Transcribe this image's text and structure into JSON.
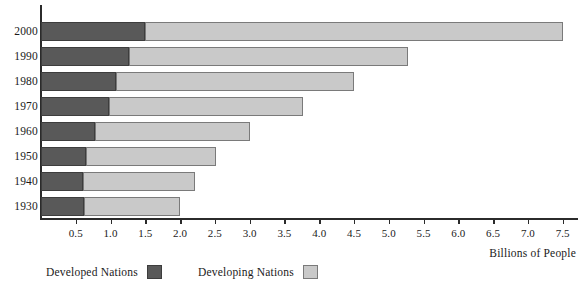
{
  "chart_data": {
    "type": "bar",
    "orientation": "horizontal",
    "stacked": true,
    "title": "",
    "xlabel": "Billions of People",
    "ylabel": "",
    "categories": [
      "2000",
      "1990",
      "1980",
      "1970",
      "1960",
      "1950",
      "1940",
      "1930"
    ],
    "series": [
      {
        "name": "Developed Nations",
        "color": "#595959",
        "values": [
          1.5,
          1.26,
          1.08,
          0.98,
          0.77,
          0.64,
          0.61,
          0.62
        ]
      },
      {
        "name": "Developing Nations",
        "color": "#c9c9c9",
        "values": [
          6.0,
          4.01,
          3.42,
          2.79,
          2.23,
          1.87,
          1.61,
          1.38
        ]
      }
    ],
    "totals": [
      7.5,
      5.27,
      4.5,
      3.77,
      3.0,
      2.51,
      2.22,
      2.0
    ],
    "xlim": [
      0,
      7.72
    ],
    "xticks": [
      0.5,
      1.0,
      1.5,
      2.0,
      2.5,
      3.0,
      3.5,
      4.0,
      4.5,
      5.0,
      5.5,
      6.0,
      6.5,
      7.0,
      7.5
    ],
    "xtick_labels": [
      "0.5",
      "1.0",
      "1.5",
      "2.0",
      "2.5",
      "3.0",
      "3.5",
      "4.0",
      "4.5",
      "5.0",
      "5.5",
      "6.0",
      "6.5",
      "7.0",
      "7.5"
    ],
    "grid": false,
    "legend_position": "bottom-left"
  },
  "axis": {
    "x_title": "Billions of People"
  },
  "legend": {
    "items": [
      {
        "label": "Developed Nations",
        "swatch": "developed"
      },
      {
        "label": "Developing Nations",
        "swatch": "developing"
      }
    ]
  },
  "colors": {
    "developed": "#595959",
    "developing": "#c9c9c9",
    "axis": "#2b2b2b",
    "background": "#ffffff"
  }
}
